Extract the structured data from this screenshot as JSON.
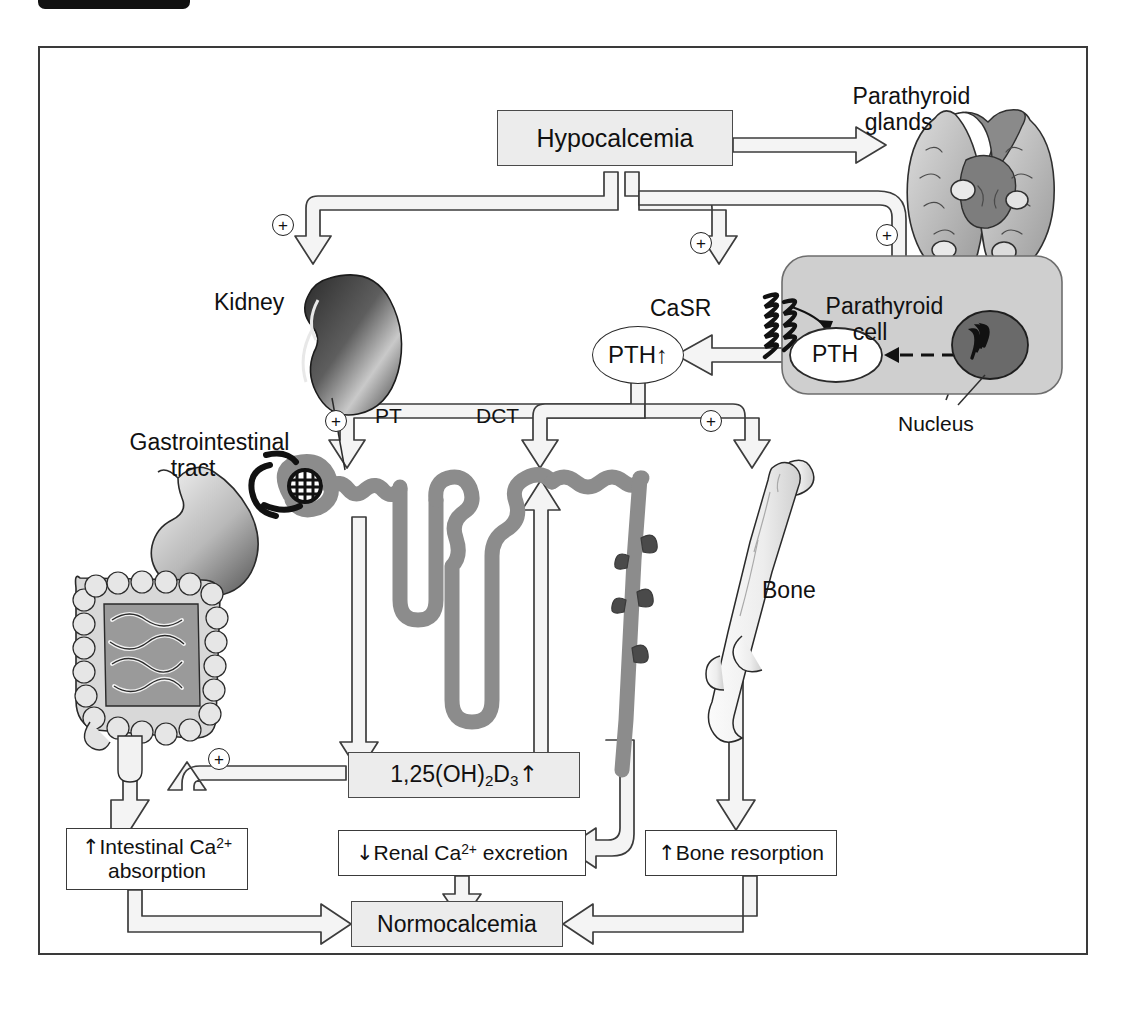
{
  "figure": {
    "type": "flow-diagram",
    "border_color": "#3a3a3a",
    "box_fill": "#ececec",
    "tissue_gray": "#8c8c8c"
  },
  "nodes": {
    "hypocalcemia": "Hypocalcemia",
    "pth_released": "PTH↑",
    "pth_vesicle": "PTH",
    "casr": "CaSR",
    "calcitriol": "1,25(OH)",
    "calcitriol_sub1": "2",
    "calcitriol_mid": "D",
    "calcitriol_sub2": "3",
    "calcitriol_arrow": "↑",
    "intestinal_line1_arrow": "↑",
    "intestinal_line1": "Intestinal Ca",
    "intestinal_sup": "2+",
    "intestinal_line2": "absorption",
    "renal_arrow": "↓",
    "renal_text": "Renal Ca",
    "renal_sup": "2+",
    "renal_text2": " excretion",
    "bone_arrow": "↑",
    "bone_text": "Bone resorption",
    "normocalcemia": "Normocalcemia"
  },
  "labels": {
    "parathyroid_glands_l1": "Parathyroid",
    "parathyroid_glands_l2": "glands",
    "parathyroid_cell_l1": "Parathyroid",
    "parathyroid_cell_l2": "cell",
    "nucleus": "Nucleus",
    "kidney": "Kidney",
    "gi_tract_l1": "Gastrointestinal",
    "gi_tract_l2": "tract",
    "bone": "Bone",
    "pt": "PT",
    "dct": "DCT"
  },
  "signs": {
    "kidney_plus": "+",
    "casr_plus": "+",
    "cell_plus": "+",
    "nephron_plus": "+",
    "bone_plus": "+",
    "gi_plus": "+"
  },
  "organs": [
    {
      "name": "parathyroid-glands-illustration"
    },
    {
      "name": "parathyroid-cell-illustration"
    },
    {
      "name": "nucleus-illustration"
    },
    {
      "name": "kidney-illustration"
    },
    {
      "name": "nephron-illustration"
    },
    {
      "name": "gastrointestinal-tract-illustration"
    },
    {
      "name": "femur-bone-illustration"
    }
  ]
}
